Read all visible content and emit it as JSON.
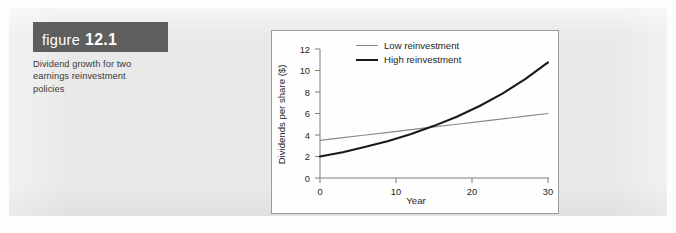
{
  "figure": {
    "label_word": "figure",
    "label_number": "12.1",
    "caption": "Dividend growth for two earnings reinvestment policies",
    "banner_color": "#5e5e5e",
    "page_background": "#e9e9e9"
  },
  "chart_data": {
    "type": "line",
    "title": "",
    "xlabel": "Year",
    "ylabel": "Dividends per share ($)",
    "xlim": [
      0,
      30
    ],
    "ylim": [
      0,
      12
    ],
    "xticks": [
      "0",
      "10",
      "20",
      "30"
    ],
    "yticks": [
      "0",
      "2",
      "4",
      "6",
      "8",
      "10",
      "12"
    ],
    "xtick_values": [
      0,
      10,
      20,
      30
    ],
    "ytick_values": [
      0,
      2,
      4,
      6,
      8,
      10,
      12
    ],
    "grid": false,
    "legend_position": "top-center",
    "x": [
      0,
      3,
      6,
      9,
      12,
      15,
      18,
      21,
      24,
      27,
      30
    ],
    "series": [
      {
        "name": "Low reinvestment",
        "color": "#8a8a8a",
        "line_width": 1.2,
        "values": [
          3.5,
          3.75,
          4.0,
          4.25,
          4.5,
          4.75,
          5.0,
          5.25,
          5.5,
          5.75,
          6.0
        ]
      },
      {
        "name": "High reinvestment",
        "color": "#1a1a1a",
        "line_width": 2.1,
        "values": [
          2.0,
          2.4,
          2.9,
          3.45,
          4.1,
          4.85,
          5.7,
          6.7,
          7.85,
          9.2,
          10.75
        ]
      }
    ],
    "annotations": [
      {
        "text": "crossover",
        "x": 13.5,
        "y": 4.6,
        "visible": false
      }
    ]
  }
}
